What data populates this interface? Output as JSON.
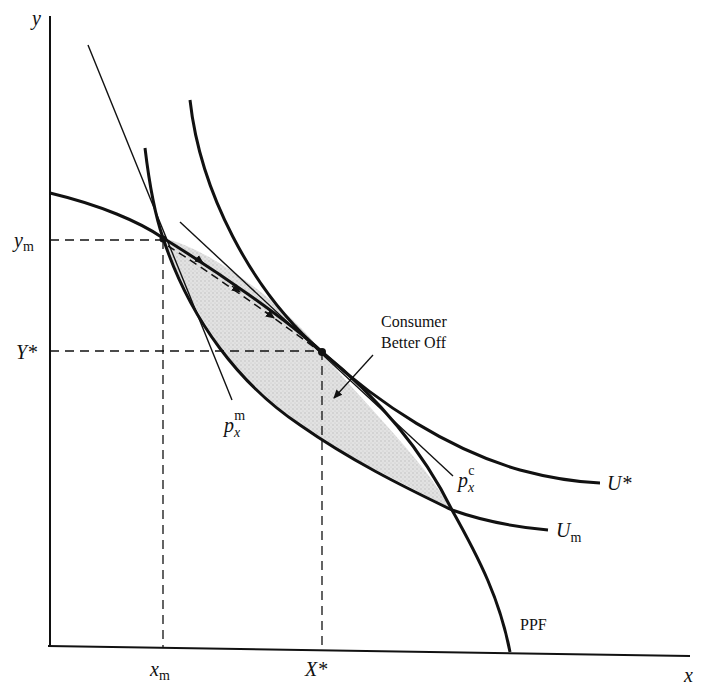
{
  "figure": {
    "type": "economics-diagram",
    "axes": {
      "x_label": "x",
      "y_label": "y"
    },
    "ticks": {
      "x": [
        {
          "label": "x",
          "subscript": "m"
        },
        {
          "label": "X*",
          "subscript": ""
        }
      ],
      "y": [
        {
          "label": "y",
          "subscript": "m"
        },
        {
          "label": "Y*",
          "subscript": ""
        }
      ]
    },
    "curves": {
      "ppf": {
        "label": "PPF"
      },
      "u_star": {
        "label": "U*"
      },
      "u_m": {
        "label": "U",
        "subscript": "m"
      }
    },
    "price_lines": {
      "monopoly": {
        "base": "p",
        "sub": "x",
        "sup": "m"
      },
      "competitive": {
        "base": "p",
        "sub": "x",
        "sup": "c"
      }
    },
    "annotation": {
      "line1": "Consumer",
      "line2": "Better Off"
    },
    "colors": {
      "ink": "#111111",
      "shade": "#d6d6d6",
      "background": "#ffffff"
    }
  }
}
